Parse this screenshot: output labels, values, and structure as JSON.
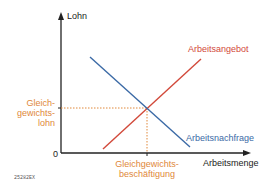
{
  "diagram": {
    "axes": {
      "y_label": "Lohn",
      "x_label": "Arbeitsmenge",
      "origin_label": "0"
    },
    "curves": {
      "supply_label": "Arbeitsangebot",
      "demand_label": "Arbeitsnachfrage"
    },
    "equilibrium": {
      "wage_label_line1": "Gleich-",
      "wage_label_line2": "gewichts-",
      "wage_label_line3": "lohn",
      "employment_label_line1": "Gleichgewichts-",
      "employment_label_line2": "beschäftigung"
    },
    "image_code": "25282EX",
    "colors": {
      "axis": "#222222",
      "supply": "#d2493a",
      "demand": "#3b6aa6",
      "equilibrium": "#e0883a"
    }
  }
}
